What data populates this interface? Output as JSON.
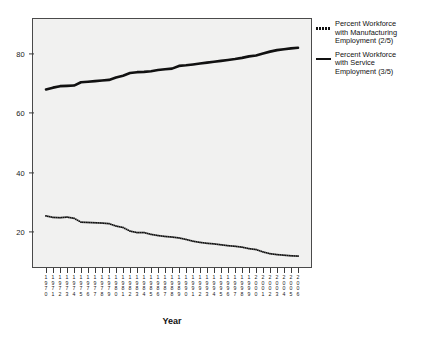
{
  "chart_data": {
    "type": "line",
    "title": "",
    "xlabel": "Year",
    "ylabel": "",
    "xlim": [
      1970,
      2006
    ],
    "ylim": [
      8,
      92
    ],
    "y_ticks": [
      20,
      40,
      60,
      80
    ],
    "grid": false,
    "legend_position": "right",
    "x": [
      1970,
      1971,
      1972,
      1973,
      1974,
      1975,
      1976,
      1977,
      1978,
      1979,
      1980,
      1981,
      1982,
      1983,
      1984,
      1985,
      1986,
      1987,
      1988,
      1989,
      1990,
      1991,
      1992,
      1993,
      1994,
      1995,
      1996,
      1997,
      1998,
      1999,
      2000,
      2001,
      2002,
      2003,
      2004,
      2005,
      2006
    ],
    "x_tick_labels": [
      "1970",
      "1971",
      "1972",
      "1973",
      "1974",
      "1975",
      "1976",
      "1977",
      "1978",
      "1979",
      "1980",
      "1981",
      "1982",
      "1983",
      "1984",
      "1985",
      "1986",
      "1987",
      "1988",
      "1989",
      "1990",
      "1991",
      "1992",
      "1993",
      "1994",
      "1995",
      "1996",
      "1997",
      "1998",
      "1999",
      "2000",
      "2001",
      "2002",
      "2003",
      "2004",
      "2005",
      "2006"
    ],
    "series": [
      {
        "name": "Percent Workforce with Manufacturing Employment (2/5)",
        "style": "dotted",
        "color": "#111111",
        "values": [
          25.5,
          25.0,
          24.9,
          25.1,
          24.7,
          23.4,
          23.3,
          23.2,
          23.1,
          22.9,
          22.1,
          21.6,
          20.4,
          19.9,
          19.9,
          19.3,
          18.9,
          18.6,
          18.4,
          18.1,
          17.6,
          17.0,
          16.6,
          16.3,
          16.1,
          15.8,
          15.5,
          15.3,
          15.0,
          14.5,
          14.2,
          13.4,
          12.8,
          12.5,
          12.3,
          12.1,
          12.0
        ]
      },
      {
        "name": "Percent Workforce with Service Employment (3/5)",
        "style": "solid",
        "color": "#111111",
        "values": [
          68.0,
          68.6,
          69.1,
          69.2,
          69.3,
          70.4,
          70.6,
          70.8,
          71.0,
          71.2,
          72.0,
          72.6,
          73.5,
          73.8,
          73.9,
          74.1,
          74.5,
          74.8,
          75.0,
          75.9,
          76.1,
          76.4,
          76.7,
          77.0,
          77.3,
          77.6,
          77.9,
          78.2,
          78.6,
          79.1,
          79.4,
          80.1,
          80.7,
          81.2,
          81.5,
          81.8,
          82.0
        ]
      }
    ]
  },
  "legend": {
    "entries": [
      {
        "key_style": "dotted",
        "label": "Percent Workforce\nwith Manufacturing\nEmployment (2/5)"
      },
      {
        "key_style": "solid",
        "label": "Percent Workforce\nwith Service\nEmployment (3/5)"
      }
    ]
  },
  "axis": {
    "x_title": "Year"
  }
}
